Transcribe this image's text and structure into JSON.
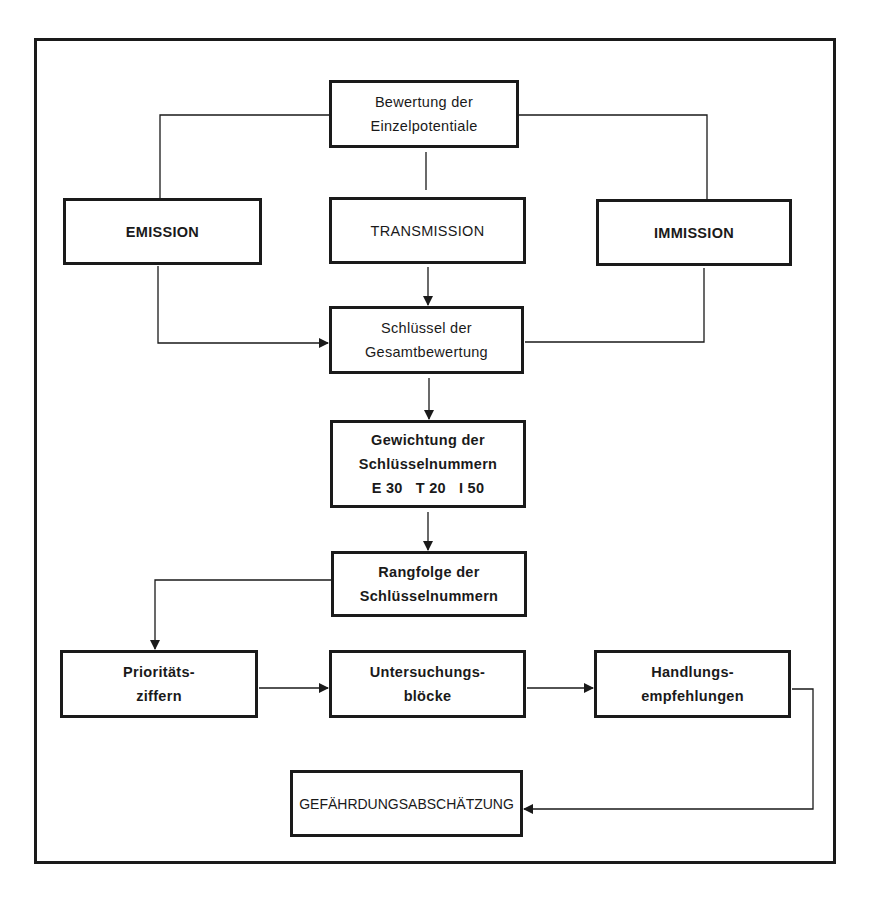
{
  "diagram": {
    "nodes": {
      "bewertung": {
        "lines": [
          "Bewertung der",
          "Einzelpotentiale"
        ]
      },
      "emission": {
        "lines": [
          "EMISSION"
        ]
      },
      "transmission": {
        "lines": [
          "TRANSMISSION"
        ]
      },
      "immission": {
        "lines": [
          "IMMISSION"
        ]
      },
      "schluessel": {
        "lines": [
          "Schlüssel der",
          "Gesamtbewertung"
        ]
      },
      "gewichtung": {
        "lines": [
          "Gewichtung der",
          "Schlüsselnummern",
          "E 30   T 20   I 50"
        ]
      },
      "rangfolge": {
        "lines": [
          "Rangfolge der",
          "Schlüsselnummern"
        ]
      },
      "prioritaet": {
        "lines": [
          "Prioritäts-",
          "ziffern"
        ]
      },
      "untersuchung": {
        "lines": [
          "Untersuchungs-",
          "blöcke"
        ]
      },
      "handlung": {
        "lines": [
          "Handlungs-",
          "empfehlungen"
        ]
      },
      "gefaehrdung": {
        "lines": [
          "GEFÄHRDUNGSABSCHÄTZUNG"
        ]
      }
    },
    "weights": {
      "E": 30,
      "T": 20,
      "I": 50
    },
    "edges": [
      {
        "from": "bewertung",
        "to": "emission",
        "arrow": false
      },
      {
        "from": "bewertung",
        "to": "transmission",
        "arrow": false
      },
      {
        "from": "bewertung",
        "to": "immission",
        "arrow": false
      },
      {
        "from": "emission",
        "to": "schluessel",
        "arrow": true
      },
      {
        "from": "transmission",
        "to": "schluessel",
        "arrow": true
      },
      {
        "from": "immission",
        "to": "schluessel",
        "arrow": false
      },
      {
        "from": "schluessel",
        "to": "gewichtung",
        "arrow": true
      },
      {
        "from": "gewichtung",
        "to": "rangfolge",
        "arrow": true
      },
      {
        "from": "rangfolge",
        "to": "prioritaet",
        "arrow": true
      },
      {
        "from": "prioritaet",
        "to": "untersuchung",
        "arrow": true
      },
      {
        "from": "untersuchung",
        "to": "handlung",
        "arrow": true
      },
      {
        "from": "handlung",
        "to": "gefaehrdung",
        "arrow": true
      }
    ],
    "colors": {
      "line": "#1a1a1a",
      "background": "#ffffff"
    }
  }
}
